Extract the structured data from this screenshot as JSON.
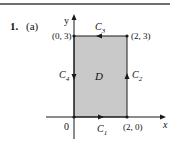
{
  "problem": {
    "number": "1.",
    "part": "(a)"
  },
  "diagram": {
    "axes": {
      "x_label": "x",
      "y_label": "y",
      "origin_label": "0"
    },
    "region_label": "D",
    "region_fill": "#c9c9c9",
    "line_color": "#1a1a1a",
    "vertices": [
      {
        "label": "(0, 3)"
      },
      {
        "label": "(2, 3)"
      },
      {
        "label": "(2, 0)"
      }
    ],
    "curves": [
      {
        "name": "C",
        "sub": "1",
        "direction": "right"
      },
      {
        "name": "C",
        "sub": "2",
        "direction": "up"
      },
      {
        "name": "C",
        "sub": "3",
        "direction": "left"
      },
      {
        "name": "C",
        "sub": "4",
        "direction": "down"
      }
    ]
  }
}
